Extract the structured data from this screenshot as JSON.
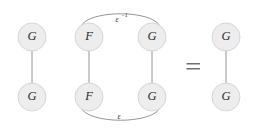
{
  "diagram": {
    "type": "string-diagram",
    "background_color": "#ffffff",
    "node_fill_color": "#ededed",
    "node_stroke_color": "#d2d2d2",
    "edge_color": "#8a8a8a",
    "label_color": "#2b2b2b",
    "groups": [
      {
        "id": "left-group",
        "name": "left-identity-diagram",
        "nodes": [
          {
            "id": "left-top",
            "label": "G",
            "cx": 32,
            "cy": 37,
            "r": 14
          },
          {
            "id": "left-bottom",
            "label": "G",
            "cx": 32,
            "cy": 97,
            "r": 14
          }
        ],
        "edges": [
          {
            "id": "left-vertical",
            "from": "left-top",
            "to": "left-bottom",
            "kind": "straight"
          }
        ]
      },
      {
        "id": "middle-group",
        "name": "conjugation-diagram",
        "nodes": [
          {
            "id": "mid-top-left",
            "label": "F",
            "cx": 89,
            "cy": 37,
            "r": 14
          },
          {
            "id": "mid-top-right",
            "label": "G",
            "cx": 152,
            "cy": 37,
            "r": 14
          },
          {
            "id": "mid-bottom-left",
            "label": "F",
            "cx": 89,
            "cy": 97,
            "r": 14
          },
          {
            "id": "mid-bottom-right",
            "label": "G",
            "cx": 152,
            "cy": 97,
            "r": 14
          }
        ],
        "edges": [
          {
            "id": "mid-left-vertical",
            "from": "mid-top-left",
            "to": "mid-bottom-left",
            "kind": "straight"
          },
          {
            "id": "mid-right-vertical",
            "from": "mid-top-right",
            "to": "mid-bottom-right",
            "kind": "straight"
          },
          {
            "id": "mid-top-arc",
            "from": "mid-top-left",
            "to": "mid-top-right",
            "kind": "arc",
            "direction": "up",
            "label_base": "ε",
            "label_exponent": "−1"
          },
          {
            "id": "mid-bottom-arc",
            "from": "mid-bottom-left",
            "to": "mid-bottom-right",
            "kind": "arc",
            "direction": "down",
            "label_base": "ε",
            "label_exponent": ""
          }
        ]
      },
      {
        "id": "right-group",
        "name": "right-identity-diagram",
        "nodes": [
          {
            "id": "right-top",
            "label": "G",
            "cx": 226,
            "cy": 37,
            "r": 14
          },
          {
            "id": "right-bottom",
            "label": "G",
            "cx": 226,
            "cy": 97,
            "r": 14
          }
        ],
        "edges": [
          {
            "id": "right-vertical",
            "from": "right-top",
            "to": "right-bottom",
            "kind": "straight"
          }
        ]
      }
    ],
    "operators": [
      {
        "id": "equals-sign",
        "symbol": "=",
        "x": 193,
        "y": 67
      }
    ],
    "labels": {
      "node_left_top": "G",
      "node_left_bottom": "G",
      "node_mid_top_left": "F",
      "node_mid_top_right": "G",
      "node_mid_bottom_left": "F",
      "node_mid_bottom_right": "G",
      "node_right_top": "G",
      "node_right_bottom": "G",
      "arc_top_base": "ε",
      "arc_top_exponent": "−1",
      "arc_bottom_base": "ε",
      "equals": "="
    }
  }
}
